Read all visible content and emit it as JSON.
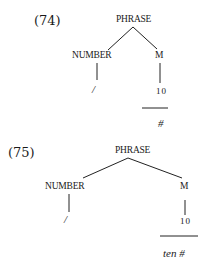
{
  "examples": [
    {
      "number": "(74)",
      "root": "PHRASE",
      "left_child": "NUMBER",
      "left_leaf": "/",
      "right_child": "M",
      "right_leaf": "10",
      "below_bar": "#"
    },
    {
      "number": "(75)",
      "root": "PHRASE",
      "left_child": "NUMBER",
      "left_leaf": "/",
      "right_child": "M",
      "right_leaf": "10",
      "below_bar": "ten #"
    }
  ]
}
